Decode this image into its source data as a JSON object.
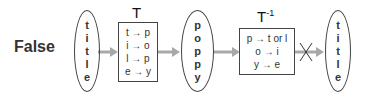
{
  "label": "False",
  "input_word": {
    "letters": [
      "t",
      "i",
      "t",
      "l",
      "e"
    ]
  },
  "transform": {
    "title": "T",
    "mappings": [
      "t → p",
      "i → o",
      "l → p",
      "e → y"
    ]
  },
  "encoded_word": {
    "letters": [
      "p",
      "o",
      "p",
      "p",
      "y"
    ]
  },
  "inverse_transform": {
    "title": "T",
    "superscript": "-1",
    "mappings": [
      {
        "text": "p → t",
        "small": "or",
        "tail": " l"
      },
      {
        "text": "o → i"
      },
      {
        "text": "y → e"
      }
    ]
  },
  "output_word": {
    "letters": [
      "t",
      "i",
      "t",
      "l",
      "e"
    ]
  },
  "colors": {
    "arrow": "#a8a8a8",
    "stroke": "#444444",
    "cross": "#333333"
  }
}
